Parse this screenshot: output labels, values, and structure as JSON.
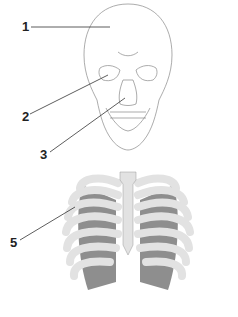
{
  "diagram": {
    "type": "anatomical skeleton labeling diagram",
    "figures": [
      "skull-front-view",
      "rib-cage-front-view"
    ],
    "labels": [
      {
        "id": "1",
        "text": "1",
        "points_to": "cranium (frontal bone)"
      },
      {
        "id": "2",
        "text": "2",
        "points_to": "orbit (eye socket)"
      },
      {
        "id": "3",
        "text": "3",
        "points_to": "nasal cavity"
      },
      {
        "id": "5",
        "text": "5",
        "points_to": "ribs"
      }
    ],
    "colors": {
      "outline": "#777777",
      "bone_fill": "#e2e2e2",
      "lung_fill": "#8e8e8e",
      "label_text": "#222222",
      "leader_line": "#333333"
    }
  }
}
